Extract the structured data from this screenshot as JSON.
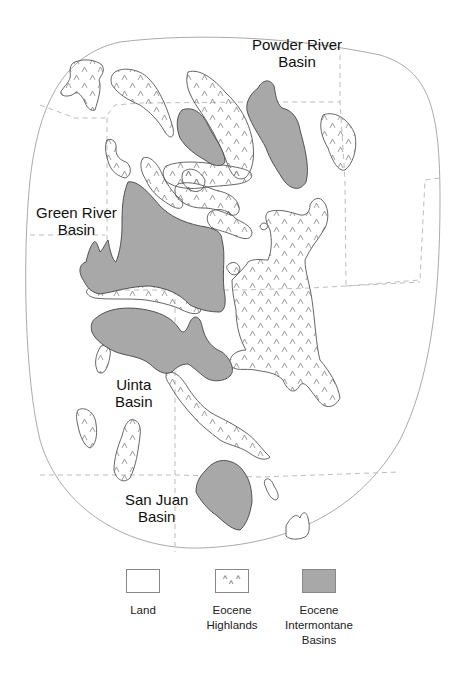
{
  "map": {
    "colors": {
      "land": "#ffffff",
      "highland_outline": "#555555",
      "basin_fill": "#a8a8a8",
      "basin_outline": "#444444",
      "state_boundary": "#bdbdbd",
      "region_outline": "#9a9a9a"
    },
    "labels": {
      "powder_river": [
        "Powder River",
        "Basin"
      ],
      "green_river": [
        "Green River",
        "Basin"
      ],
      "uinta": [
        "Uinta",
        "Basin"
      ],
      "san_juan": [
        "San Juan",
        "Basin"
      ]
    },
    "highland_symbol": "^"
  },
  "legend": {
    "items": [
      {
        "key": "land",
        "label": [
          "Land"
        ],
        "icon": "empty-swatch"
      },
      {
        "key": "highlands",
        "label": [
          "Eocene",
          "Highlands"
        ],
        "icon": "caret-pattern-swatch"
      },
      {
        "key": "basins",
        "label": [
          "Eocene",
          "Intermontane",
          "Basins"
        ],
        "icon": "gray-fill-swatch"
      }
    ]
  }
}
